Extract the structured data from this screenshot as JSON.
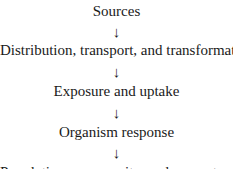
{
  "diagram": {
    "type": "flow",
    "direction": "top-to-bottom",
    "nodes": [
      {
        "label": "Sources"
      },
      {
        "label": "Distribution, transport, and transformation"
      },
      {
        "label": "Exposure and uptake"
      },
      {
        "label": "Organism response"
      },
      {
        "label": "Population, community, and ecosystem response"
      }
    ],
    "arrow_glyph": "↓"
  }
}
